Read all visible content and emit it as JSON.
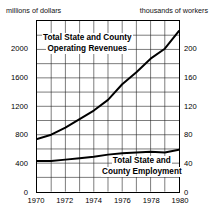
{
  "chart_data": {
    "type": "line",
    "title": "",
    "xlabel": "",
    "left_axis_caption": "millions of dollars",
    "right_axis_caption": "thousands of workers",
    "x": [
      1970,
      1971,
      1972,
      1973,
      1974,
      1975,
      1976,
      1977,
      1978,
      1979,
      1980
    ],
    "xlim": [
      1970,
      1980
    ],
    "xticks": [
      1970,
      1972,
      1974,
      1976,
      1978,
      1980
    ],
    "xtick_labels": [
      "1970",
      "1972",
      "1974",
      "1976",
      "1978",
      "1980"
    ],
    "ylim": [
      0,
      2400
    ],
    "yticks": [
      0,
      400,
      800,
      1200,
      1600,
      2000
    ],
    "ytick_labels": [
      "0",
      "400",
      "800",
      "1200",
      "1600",
      "2000"
    ],
    "y2lim": [
      0,
      240
    ],
    "y2ticks": [
      0,
      40,
      80,
      120,
      160,
      200
    ],
    "y2tick_labels": [
      "0",
      "40",
      "80",
      "120",
      "160",
      "200"
    ],
    "grid": true,
    "legend_position": "inline-annotations",
    "series": [
      {
        "name": "Total State and County Operating Revenues",
        "axis": "left",
        "units": "millions of dollars",
        "label_line1": "Total State and County",
        "label_line2": "Operating Revenues",
        "values": [
          740,
          800,
          900,
          1020,
          1140,
          1290,
          1510,
          1680,
          1870,
          2010,
          2260
        ]
      },
      {
        "name": "Total State and County Employment",
        "axis": "right",
        "units": "thousands of workers",
        "label_line1": "Total State and Can",
        "label_line2": "County Employment",
        "values": [
          43,
          43,
          45,
          47,
          49,
          52,
          54,
          55,
          56,
          55,
          59
        ]
      }
    ]
  },
  "annotations": {
    "revenue_line1": "Total State and County",
    "revenue_line2": "Operating Revenues",
    "employment_line1": "Total State and",
    "employment_line2": "County Employment"
  }
}
